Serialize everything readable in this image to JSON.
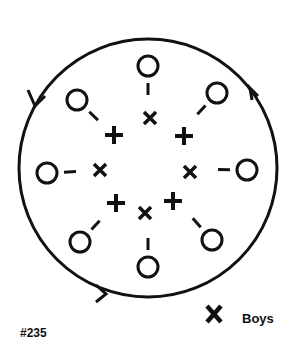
{
  "figure": {
    "number": "#235",
    "legend": {
      "symbol": "X",
      "label": "Boys"
    },
    "outer_circle": {
      "cx": 148,
      "cy": 168,
      "r": 129,
      "direction": "counter-clockwise"
    },
    "girls_circles": [
      {
        "x": 148,
        "y": 66
      },
      {
        "x": 217,
        "y": 93
      },
      {
        "x": 247,
        "y": 170
      },
      {
        "x": 212,
        "y": 240
      },
      {
        "x": 148,
        "y": 267
      },
      {
        "x": 80,
        "y": 242
      },
      {
        "x": 47,
        "y": 173
      },
      {
        "x": 77,
        "y": 100
      }
    ],
    "boys_x": [
      {
        "x": 150,
        "y": 118
      },
      {
        "x": 190,
        "y": 172
      },
      {
        "x": 145,
        "y": 213
      },
      {
        "x": 100,
        "y": 170
      }
    ],
    "plus_marks": [
      {
        "x": 184,
        "y": 136
      },
      {
        "x": 173,
        "y": 201
      },
      {
        "x": 116,
        "y": 203
      },
      {
        "x": 114,
        "y": 135
      }
    ]
  }
}
